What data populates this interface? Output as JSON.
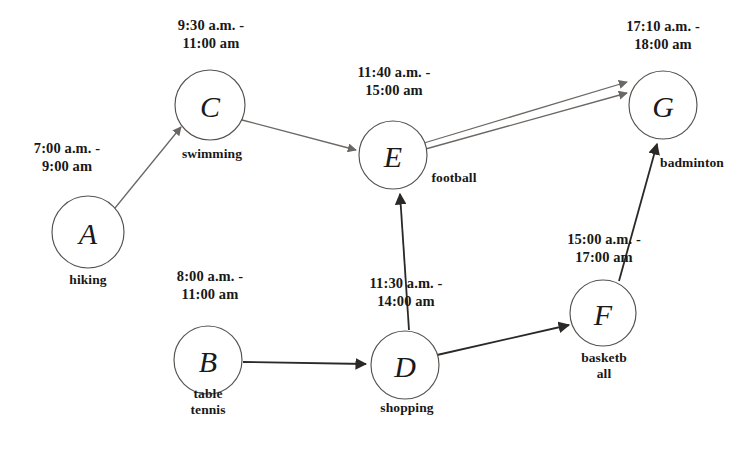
{
  "diagram": {
    "type": "directed-graph",
    "canvas": {
      "width": 756,
      "height": 455,
      "background": "#ffffff"
    },
    "colors": {
      "node_stroke": "#55524f",
      "node_fill": "#ffffff",
      "edge_light": "#6b6764",
      "edge_dark": "#2b2826",
      "text": "#181818"
    },
    "nodes": [
      {
        "id": "A",
        "letter": "A",
        "activity": "hiking",
        "time": "7:00 a.m. -\n9:00 am",
        "cx": 88,
        "cy": 232,
        "r": 36,
        "time_label": {
          "left": 2,
          "top": 140,
          "width": 130
        },
        "activity_label": {
          "left": 38,
          "top": 272,
          "width": 100
        }
      },
      {
        "id": "B",
        "letter": "B",
        "activity": "table\ntennis",
        "time": "8:00 a.m. -\n11:00 am",
        "cx": 208,
        "cy": 360,
        "r": 34,
        "time_label": {
          "left": 148,
          "top": 268,
          "width": 124
        },
        "activity_label": {
          "left": 160,
          "top": 386,
          "width": 96
        }
      },
      {
        "id": "C",
        "letter": "C",
        "activity": "swimming",
        "time": "9:30 a.m. -\n11:00 am",
        "cx": 210,
        "cy": 105,
        "r": 35,
        "time_label": {
          "left": 148,
          "top": 17,
          "width": 126
        },
        "activity_label": {
          "left": 156,
          "top": 146,
          "width": 112
        }
      },
      {
        "id": "D",
        "letter": "D",
        "activity": "shopping",
        "time": "11:30 a.m. -\n14:00 am",
        "cx": 405,
        "cy": 365,
        "r": 34,
        "time_label": {
          "left": 340,
          "top": 275,
          "width": 132
        },
        "activity_label": {
          "left": 355,
          "top": 400,
          "width": 104
        }
      },
      {
        "id": "E",
        "letter": "E",
        "activity": "football",
        "time": "11:40 a.m. -\n15:00 am",
        "cx": 393,
        "cy": 155,
        "r": 34,
        "time_label": {
          "left": 327,
          "top": 64,
          "width": 134
        },
        "activity_label": {
          "left": 418,
          "top": 170,
          "width": 72
        }
      },
      {
        "id": "F",
        "letter": "F",
        "activity": "basketb\nall",
        "time": "15:00 a.m. -\n17:00 am",
        "cx": 603,
        "cy": 313,
        "r": 33,
        "time_label": {
          "left": 538,
          "top": 231,
          "width": 132
        },
        "activity_label": {
          "left": 561,
          "top": 350,
          "width": 86
        }
      },
      {
        "id": "G",
        "letter": "G",
        "activity": "badminton",
        "time": "17:10 a.m. -\n18:00 am",
        "cx": 663,
        "cy": 105,
        "r": 34,
        "time_label": {
          "left": 596,
          "top": 18,
          "width": 134
        },
        "activity_label": {
          "left": 637,
          "top": 155,
          "width": 110
        }
      }
    ],
    "edges": [
      {
        "id": "A-C",
        "from": "A",
        "to": "C",
        "weight": "light"
      },
      {
        "id": "C-E",
        "from": "C",
        "to": "E",
        "weight": "light"
      },
      {
        "id": "E-G-upper",
        "from": "E",
        "to": "G",
        "weight": "light"
      },
      {
        "id": "E-G-lower",
        "from": "E",
        "to": "G",
        "weight": "light"
      },
      {
        "id": "B-D",
        "from": "B",
        "to": "D",
        "weight": "dark"
      },
      {
        "id": "D-E",
        "from": "D",
        "to": "E",
        "weight": "dark"
      },
      {
        "id": "D-F",
        "from": "D",
        "to": "F",
        "weight": "dark"
      },
      {
        "id": "F-G",
        "from": "F",
        "to": "G",
        "weight": "dark"
      }
    ]
  }
}
